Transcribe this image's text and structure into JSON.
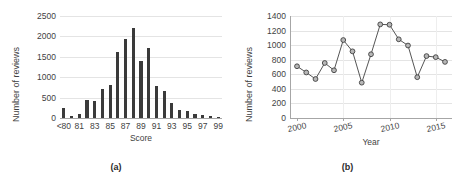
{
  "figure": {
    "panels": [
      {
        "caption": "(a)",
        "chart_data": {
          "type": "bar",
          "title": "",
          "xlabel": "Score",
          "ylabel": "Number of reviews",
          "ylim": [
            0,
            2500
          ],
          "yticks": [
            0,
            500,
            1000,
            1500,
            2000,
            2500
          ],
          "grid": true,
          "legend": "none",
          "categories": [
            "<80",
            "80",
            "81",
            "82",
            "83",
            "84",
            "85",
            "86",
            "87",
            "88",
            "89",
            "90",
            "91",
            "92",
            "93",
            "94",
            "95",
            "96",
            "97",
            "98",
            "99"
          ],
          "tick_labels": [
            "<80",
            "81",
            "83",
            "85",
            "87",
            "89",
            "91",
            "93",
            "95",
            "97",
            "99"
          ],
          "values": [
            250,
            40,
            110,
            450,
            410,
            700,
            820,
            1610,
            1930,
            2200,
            1390,
            1710,
            790,
            670,
            380,
            190,
            160,
            110,
            80,
            50,
            25
          ]
        }
      },
      {
        "caption": "(b)",
        "chart_data": {
          "type": "line",
          "title": "",
          "xlabel": "Year",
          "ylabel": "Number of reviews",
          "ylim": [
            0,
            1400
          ],
          "yticks": [
            0,
            200,
            400,
            600,
            800,
            1000,
            1200,
            1400
          ],
          "xlim": [
            2000,
            2016
          ],
          "xticks": [
            2000,
            2005,
            2010,
            2015
          ],
          "grid": true,
          "legend": "none",
          "marker": "circle",
          "x": [
            2000,
            2001,
            2002,
            2003,
            2004,
            2005,
            2006,
            2007,
            2008,
            2009,
            2010,
            2011,
            2012,
            2013,
            2014,
            2015,
            2016
          ],
          "values": [
            710,
            625,
            535,
            755,
            655,
            1070,
            915,
            485,
            875,
            1285,
            1280,
            1080,
            995,
            560,
            850,
            835,
            770
          ]
        }
      }
    ]
  },
  "colors": {
    "bar": "#3a3a3a",
    "line": "#555555",
    "marker_fill": "#b7b7b7",
    "marker_stroke": "#404040",
    "grid": "#e4e4e4",
    "axis": "#a6a6a6",
    "text": "#3f3f3f",
    "background": "#ffffff"
  }
}
